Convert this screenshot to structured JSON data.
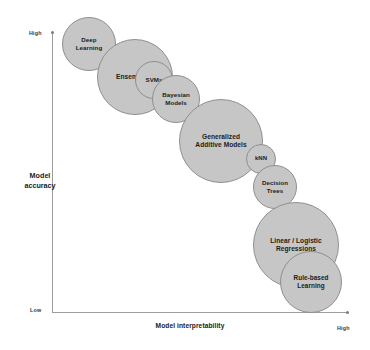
{
  "chart_data": {
    "type": "scatter",
    "title": "",
    "subtitle": "",
    "xlabel": "Model interpretability",
    "ylabel": "Model accuracy",
    "xlim": [
      "Low",
      "High"
    ],
    "ylim": [
      "Low",
      "High"
    ],
    "x_tick_labels": [
      "High"
    ],
    "y_tick_labels": [
      "High",
      "Low"
    ],
    "grid": false,
    "legend": "none",
    "annotation": "Bubble size indicates relative model complexity; bubbles are ordered along a trade-off line from high accuracy / low interpretability to low accuracy / high interpretability.",
    "bubble_fill": "#c6c6c6",
    "bubble_stroke": "#8f8f8f",
    "axis_color": "#9d9d9d",
    "points": [
      {
        "label": "Deep\nLearning",
        "interpretability": 0.06,
        "accuracy": 0.96,
        "size": 54,
        "cx": 89,
        "cy": 44,
        "d": 54,
        "font": 6.2
      },
      {
        "label": "Ensembling",
        "interpretability": 0.19,
        "accuracy": 0.87,
        "size": 76,
        "cx": 135,
        "cy": 77,
        "d": 76,
        "font": 6.6
      },
      {
        "label": "SVMs",
        "interpretability": 0.32,
        "accuracy": 0.78,
        "size": 38,
        "cx": 154,
        "cy": 80,
        "d": 38,
        "font": 6.2
      },
      {
        "label": "Bayesian\nModels",
        "interpretability": 0.4,
        "accuracy": 0.71,
        "size": 48,
        "cx": 176,
        "cy": 99,
        "d": 48,
        "font": 6.2
      },
      {
        "label": "Generalized\nAdditive Models",
        "interpretability": 0.54,
        "accuracy": 0.56,
        "size": 84,
        "cx": 221,
        "cy": 141,
        "d": 84,
        "font": 6.6
      },
      {
        "label": "kNN",
        "interpretability": 0.68,
        "accuracy": 0.46,
        "size": 30,
        "cx": 261,
        "cy": 159,
        "d": 30,
        "font": 6.0
      },
      {
        "label": "Decision\nTrees",
        "interpretability": 0.74,
        "accuracy": 0.39,
        "size": 44,
        "cx": 275,
        "cy": 187,
        "d": 44,
        "font": 6.2
      },
      {
        "label": "Linear / Logistic\nRegressions",
        "interpretability": 0.86,
        "accuracy": 0.24,
        "size": 86,
        "cx": 296,
        "cy": 245,
        "d": 86,
        "font": 6.6
      },
      {
        "label": "Rule-based\nLearning",
        "interpretability": 0.96,
        "accuracy": 0.11,
        "size": 62,
        "cx": 311,
        "cy": 282,
        "d": 62,
        "font": 6.4
      }
    ]
  },
  "axes": {
    "y_title": "Model\naccuracy",
    "x_title": "Model interpretability",
    "y_high": "High",
    "y_low": "Low",
    "x_high": "High"
  }
}
